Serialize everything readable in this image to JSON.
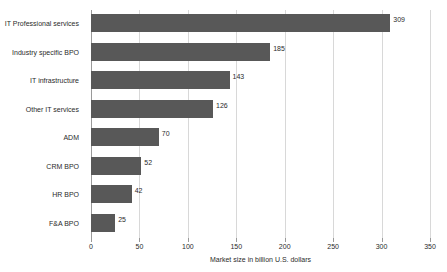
{
  "chart_data": {
    "type": "bar",
    "orientation": "horizontal",
    "title": "",
    "xlabel": "Market size in billion U.S. dollars",
    "ylabel": "",
    "xlim": [
      0,
      350
    ],
    "xticks": [
      0,
      50,
      100,
      150,
      200,
      250,
      300,
      350
    ],
    "grid": "vertical",
    "legend": "none",
    "bar_color": "#585858",
    "gridline_color": "#d8d8d8",
    "axis_color": "#9a9a9a",
    "categories": [
      "IT Professional services",
      "Industry specific BPO",
      "IT infrastructure",
      "Other IT services",
      "ADM",
      "CRM BPO",
      "HR BPO",
      "F&A BPO"
    ],
    "values": [
      309,
      185,
      143,
      126,
      70,
      52,
      42,
      25
    ],
    "value_labels": [
      "309",
      "185",
      "143",
      "126",
      "70",
      "52",
      "42",
      "25"
    ],
    "xtick_labels": [
      "0",
      "50",
      "100",
      "150",
      "200",
      "250",
      "300",
      "350"
    ]
  }
}
